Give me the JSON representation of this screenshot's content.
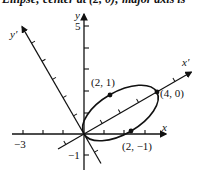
{
  "caption": "Ellipse; center at (2, 0); major axis is",
  "diagram": {
    "type": "rotated-ellipse-plot",
    "rotation_deg": 30,
    "axes": {
      "x_label": "x",
      "y_label": "y",
      "x_prime_label": "x′",
      "y_prime_label": "y′",
      "tick_labels": {
        "x_neg3": "−3",
        "y_5": "5",
        "y_neg1": "−1"
      }
    },
    "ellipse": {
      "center_prime": [
        2,
        0
      ],
      "semi_major": 2,
      "semi_minor": 1
    },
    "points": [
      {
        "label": "(2, 1)",
        "prime_coords": [
          2,
          1
        ]
      },
      {
        "label": "(4, 0)",
        "prime_coords": [
          4,
          0
        ]
      },
      {
        "label": "(2, −1)",
        "prime_coords": [
          2,
          -1
        ]
      }
    ],
    "colors": {
      "ink": "#111111",
      "background": "#ffffff"
    }
  }
}
